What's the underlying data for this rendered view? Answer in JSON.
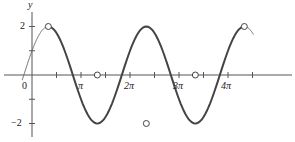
{
  "chart_data": {
    "type": "line",
    "title": "",
    "function": "y = 2cos(x - π/3)",
    "xlabel": "",
    "ylabel": "y",
    "x_tick_labels": [
      "0",
      "π",
      "2π",
      "3π",
      "4π"
    ],
    "y_tick_labels": [
      "2",
      "−2"
    ],
    "xlim": [
      -0.63,
      14.2
    ],
    "ylim": [
      -2.2,
      2.3
    ],
    "grid": false,
    "legend": null,
    "series": [
      {
        "name": "curve",
        "x": [
          -0.63,
          1.047,
          4.189,
          7.33,
          10.472,
          13.614,
          14.2
        ],
        "y": [
          1.4,
          2,
          0,
          -2,
          0,
          2,
          1.6
        ]
      }
    ],
    "marked_points": [
      {
        "x": 1.047,
        "y": 2
      },
      {
        "x": 4.189,
        "y": 0
      },
      {
        "x": 7.33,
        "y": -2
      },
      {
        "x": 10.472,
        "y": 0
      },
      {
        "x": 13.614,
        "y": 2
      }
    ],
    "x_minor_tick_step": "π/2"
  },
  "labels": {
    "y_axis": "y",
    "origin": "0",
    "x_ticks": [
      "π",
      "2π",
      "3π",
      "4π"
    ],
    "y_pos": "2",
    "y_neg": "−2"
  }
}
